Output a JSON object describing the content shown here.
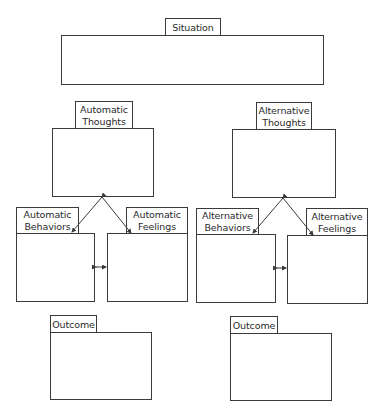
{
  "situation": {
    "label": "Situation"
  },
  "automatic": {
    "thoughts": {
      "line1": "Automatic",
      "line2": "Thoughts"
    },
    "behaviors": {
      "line1": "Automatic",
      "line2": "Behaviors"
    },
    "feelings": {
      "line1": "Automatic",
      "line2": "Feelings"
    },
    "outcome": {
      "label": "Outcome"
    }
  },
  "alternative": {
    "thoughts": {
      "line1": "Alternative",
      "line2": "Thoughts"
    },
    "behaviors": {
      "line1": "Alternative",
      "line2": "Behaviors"
    },
    "feelings": {
      "line1": "Alternative",
      "line2": "Feelings"
    },
    "outcome": {
      "label": "Outcome"
    }
  },
  "colors": {
    "line": "#3a3a3a",
    "background": "#ffffff"
  }
}
